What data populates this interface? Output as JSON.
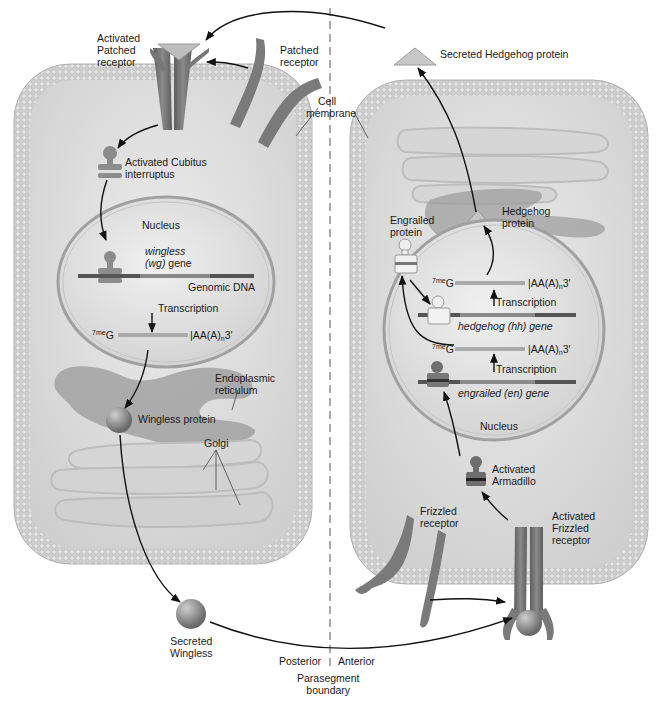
{
  "figure": {
    "left_cell": {
      "region": "Posterior",
      "labels": {
        "activated_patched_receptor": [
          "Activated",
          "Patched",
          "receptor"
        ],
        "patched_receptor": [
          "Patched",
          "receptor"
        ],
        "activated_cubitus": [
          "Activated Cubitus",
          "interruptus"
        ],
        "nucleus": "Nucleus",
        "gene_line1": "wingless",
        "gene_line2_italic": "(wg)",
        "gene_line2_rest": " gene",
        "genomic_dna": "Genomic DNA",
        "transcription": "Transcription",
        "mrna_cap_sup": "7me",
        "mrna_cap": "G",
        "mrna_tail": "AA(A)",
        "mrna_tail_sub": "n",
        "mrna_tail_end": "3′",
        "er": [
          "Endoplasmic",
          "reticulum"
        ],
        "wingless_protein": "Wingless protein",
        "golgi": "Golgi",
        "secreted_wingless": [
          "Secreted",
          "Wingless"
        ]
      }
    },
    "right_cell": {
      "region": "Anterior",
      "labels": {
        "secreted_hedgehog": "Secreted Hedgehog protein",
        "hedgehog_protein": [
          "Hedgehog",
          "protein"
        ],
        "engrailed_protein": [
          "Engrailed",
          "protein"
        ],
        "mrna_cap_sup": "7me",
        "mrna_cap": "G",
        "mrna_tail": "AA(A)",
        "mrna_tail_sub": "n",
        "mrna_tail_end": "3′",
        "transcription": "Transcription",
        "hh_gene": "hedgehog (hh) gene",
        "en_gene": "engrailed (en) gene",
        "nucleus": "Nucleus",
        "activated_armadillo": [
          "Activated",
          "Armadillo"
        ],
        "frizzled_receptor": [
          "Frizzled",
          "receptor"
        ],
        "activated_frizzled": [
          "Activated",
          "Frizzled",
          "receptor"
        ]
      }
    },
    "shared": {
      "cell_membrane": [
        "Cell",
        "membrane"
      ],
      "posterior": "Posterior",
      "anterior": "Anterior",
      "boundary": [
        "Parasegment",
        "boundary"
      ]
    },
    "colors": {
      "membrane": "#c9c9c9",
      "cytoplasm": "#dcdcdc",
      "receptor": "#7a7a7a",
      "hedgehog_triangle": "#bdbdbd",
      "arrow": "#111111"
    }
  }
}
